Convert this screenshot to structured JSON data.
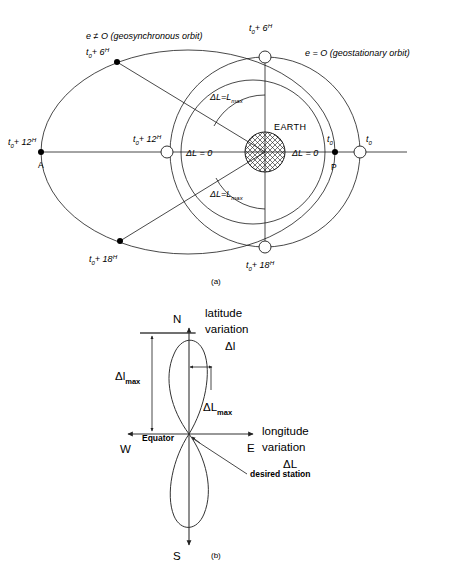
{
  "figure_a": {
    "caption": "(a)",
    "orbit_labels": {
      "eccentric": "e ≠ O (geosynchronous orbit)",
      "circular": "e = O (geostationary orbit)"
    },
    "earth_label": "EARTH",
    "time_base": "t",
    "time_sub": "0",
    "markers": [
      {
        "name": "apogee-eccentric",
        "time": "t",
        "sub": "0",
        "plus": "+ 12",
        "sup": "H",
        "extra": "A",
        "type": "filled"
      },
      {
        "name": "t6-eccentric",
        "time": "t",
        "sub": "0",
        "plus": "+ 6",
        "sup": "H",
        "extra": "",
        "type": "filled"
      },
      {
        "name": "t18-eccentric",
        "time": "t",
        "sub": "0",
        "plus": "+ 18",
        "sup": "H",
        "extra": "",
        "type": "filled"
      },
      {
        "name": "perigee-eccentric",
        "time": "t",
        "sub": "0",
        "plus": "",
        "sup": "",
        "extra": "P",
        "type": "filled"
      },
      {
        "name": "t0-circular",
        "time": "t",
        "sub": "0",
        "plus": "",
        "sup": "",
        "extra": "",
        "type": "open"
      },
      {
        "name": "t6-circular",
        "time": "t",
        "sub": "0",
        "plus": "+ 6",
        "sup": "H",
        "extra": "",
        "type": "open"
      },
      {
        "name": "t12-circular",
        "time": "t",
        "sub": "0",
        "plus": "+ 12",
        "sup": "H",
        "extra": "",
        "type": "open"
      },
      {
        "name": "t18-circular",
        "time": "t",
        "sub": "0",
        "plus": "+ 18",
        "sup": "H",
        "extra": "",
        "type": "open"
      }
    ],
    "delta_labels": {
      "zero_left": "ΔL = 0",
      "zero_right": "ΔL = 0",
      "max_top_prefix": "ΔL=L",
      "max_top_sub": "max",
      "max_bottom_prefix": "ΔL=L",
      "max_bottom_sub": "max"
    }
  },
  "figure_b": {
    "caption": "(b)",
    "compass": {
      "north": "N",
      "south": "S",
      "west": "W",
      "east": "E"
    },
    "equator_label": "Equator",
    "latitude": {
      "line1": "latitude",
      "line2": "variation",
      "line3": "Δl"
    },
    "longitude": {
      "line1": "longitude",
      "line2": "variation",
      "line3": "ΔL"
    },
    "delta_l_max": {
      "prefix": "Δl",
      "sub": "max"
    },
    "delta_L_max": {
      "prefix": "ΔL",
      "sub": "max"
    },
    "station_label": "desired station"
  },
  "colors": {
    "ink": "#1a1a1a",
    "paper": "#ffffff"
  }
}
